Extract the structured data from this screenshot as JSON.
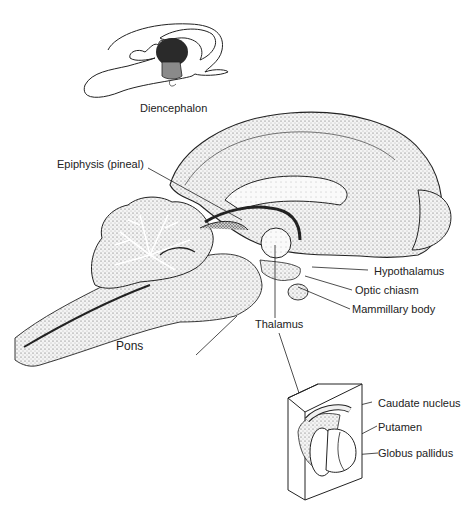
{
  "inset": {
    "label": "Diencephalon",
    "colors": {
      "thalamus_region": "#2a2a2a",
      "hypothalamus_region": "#8a8a8a"
    }
  },
  "main_labels": {
    "epiphysis": "Epiphysis (pineal)",
    "hypothalamus": "Hypothalamus",
    "optic_chiasm": "Optic chiasm",
    "mammillary_body": "Mammillary body",
    "thalamus": "Thalamus",
    "pons": "Pons"
  },
  "detail_box": {
    "caudate": "Caudate nucleus",
    "putamen": "Putamen",
    "globus_pallidus": "Globus pallidus"
  }
}
